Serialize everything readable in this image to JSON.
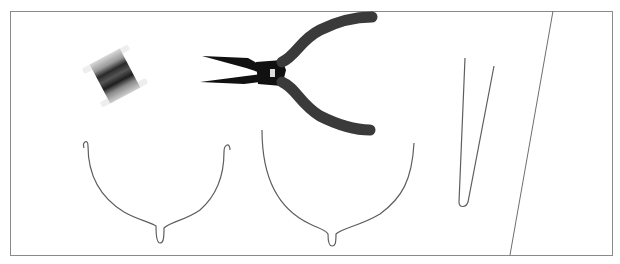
{
  "figure": {
    "description": "Illustration of wire-working craft tools and shaped wire frames on a white background inside a thin gray border",
    "colors": {
      "background": "#ffffff",
      "frame": "#8a8a8a",
      "wire": "#6e6e6e",
      "pliers_dark": "#111111",
      "pliers_handle": "#3a3a3a",
      "spool_light": "#e8e8e8",
      "spool_dark": "#2a2a2a"
    },
    "objects": [
      {
        "name": "wire-spool",
        "label": "Spool of wire"
      },
      {
        "name": "pliers",
        "label": "Round-nose pliers"
      },
      {
        "name": "wire-frame-hooked",
        "label": "Wire frame with hooked ends"
      },
      {
        "name": "wire-frame-open",
        "label": "Wire frame with open ends"
      },
      {
        "name": "wire-hairpin",
        "label": "Hairpin-bent wire"
      }
    ]
  }
}
